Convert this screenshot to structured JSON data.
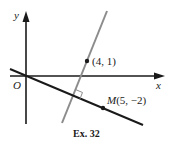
{
  "figure": {
    "caption": "Ex. 32",
    "axes": {
      "x_label": "x",
      "y_label": "y",
      "origin_label": "O"
    },
    "points": [
      {
        "id": "P",
        "label": "(4, 1)",
        "coords": [
          4,
          1
        ]
      },
      {
        "id": "M",
        "name": "M",
        "label": "M(5, −2)",
        "coords_text": "(5, −2)",
        "coords": [
          5,
          -2
        ]
      }
    ],
    "lines": [
      {
        "id": "line-through-origin-and-M",
        "color": "#1a1a1a",
        "description": "line through O and M"
      },
      {
        "id": "perpendicular-through-4-1",
        "color": "#8a8a8a",
        "description": "line through (4, 1) perpendicular to OM"
      }
    ],
    "right_angle_marker": true,
    "colors": {
      "axis": "#1a1a1a",
      "dark_line": "#1a1a1a",
      "gray_line": "#8c8c8c",
      "background": "#ffffff"
    }
  }
}
